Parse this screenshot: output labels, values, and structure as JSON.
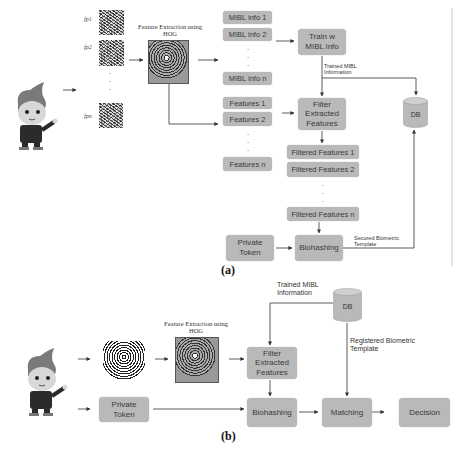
{
  "panel_a": {
    "label": "(a)",
    "fingerprint_labels": [
      "fp1",
      "fp2",
      "fpn"
    ],
    "hog_title": "Feature Extraction using HOG",
    "mibl_items": [
      "MIBL info 1",
      "MIBL info 2",
      "MIBL info n"
    ],
    "train_box": "Train w MIBL info",
    "trained_info_label": "Trained MIBL Information",
    "feature_items": [
      "Features 1",
      "Features 2",
      "Features n"
    ],
    "filter_box": "Filter Extracted Features",
    "filtered_items": [
      "Filtered Features 1",
      "Filtered Features 2",
      "Filtered Features n"
    ],
    "private_token": "Private Token",
    "biohashing": "Biohashing",
    "secured_template_label": "Secured Biometric Template",
    "db": "DB"
  },
  "panel_b": {
    "label": "(b)",
    "hog_title": "Feature Extraction using HOG",
    "trained_info_label": "Trained MIBL Information",
    "db": "DB",
    "registered_template_label": "Registered Biometric Template",
    "filter_box": "Filter Extracted Features",
    "private_token": "Private Token",
    "biohashing": "Biohashing",
    "matching": "Matching",
    "decision": "Decision"
  },
  "colors": {
    "box_fill": "#b9b9b9",
    "line": "#333333",
    "text": "#3a3a3a"
  }
}
